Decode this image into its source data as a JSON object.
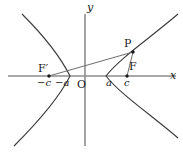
{
  "figure": {
    "type": "hyperbola-diagram",
    "width": 183,
    "height": 153,
    "background": "#ffffff",
    "curve_color": "#3a3a3a",
    "axis_color": "#8c8c8c",
    "segment_color": "#6e6e6e",
    "label_color": "#1a1a1a"
  },
  "axes": {
    "x_label": "x",
    "y_label": "y",
    "origin_label": "O",
    "origin_px": {
      "x": 85,
      "y": 76
    },
    "x_axis_px": {
      "x1": 8,
      "y1": 76,
      "x2": 176,
      "y2": 76
    },
    "y_axis_px": {
      "x1": 85,
      "y1": 14,
      "x2": 85,
      "y2": 146
    }
  },
  "ticks": [
    {
      "name": "minus-c",
      "label": "−c",
      "x_px": 49
    },
    {
      "name": "minus-a",
      "label": "−a",
      "x_px": 64
    },
    {
      "name": "a",
      "label": "a",
      "x_px": 110
    },
    {
      "name": "c",
      "label": "c",
      "x_px": 127
    }
  ],
  "points": [
    {
      "name": "focus-left",
      "label": "F′",
      "x_px": 49,
      "y_px": 76
    },
    {
      "name": "focus-right",
      "label": "F",
      "x_px": 127,
      "y_px": 76
    },
    {
      "name": "point-p",
      "label": "P",
      "x_px": 133,
      "y_px": 52
    }
  ],
  "segments": [
    {
      "name": "segment-pf-prime",
      "from": "F′",
      "to": "P"
    },
    {
      "name": "segment-pf",
      "from": "F",
      "to": "P"
    }
  ],
  "curve": {
    "name": "hyperbola",
    "vertex_left_px": 70,
    "vertex_right_px": 106,
    "description": "two opposing branches opening left and right"
  }
}
